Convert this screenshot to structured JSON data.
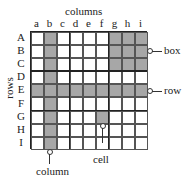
{
  "title": "columns",
  "rows_title": "rows",
  "columns": [
    "a",
    "b",
    "c",
    "d",
    "e",
    "f",
    "g",
    "h",
    "i"
  ],
  "rows": [
    "A",
    "B",
    "C",
    "D",
    "E",
    "F",
    "G",
    "H",
    "I"
  ],
  "annotations": {
    "box": "box",
    "row": "row",
    "cell": "cell",
    "column": "column"
  },
  "colors": {
    "shade": "#a7a7a7",
    "line": "#222222"
  },
  "shaded": {
    "column": "b",
    "row": "E",
    "box": "top-right (rows A-C, columns g-i)",
    "cell": "G-f"
  }
}
